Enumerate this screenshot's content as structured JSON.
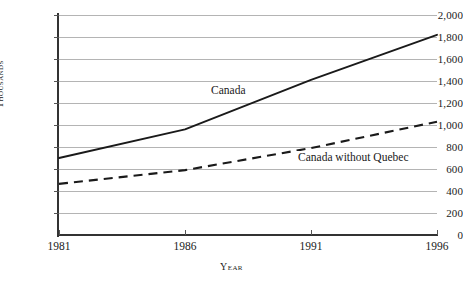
{
  "chart_data": {
    "type": "line",
    "title": "",
    "xlabel": "Year",
    "ylabel": "Thousands",
    "x": [
      1981,
      1986,
      1991,
      1996
    ],
    "xtick_labels": [
      "1981",
      "1986",
      "1991",
      "1996"
    ],
    "xlim": [
      1981,
      1996
    ],
    "ylim": [
      0,
      2000
    ],
    "ytick_labels": [
      "0",
      "200",
      "400",
      "600",
      "800",
      "1,000",
      "1,200",
      "1,400",
      "1,600",
      "1,800",
      "2,000"
    ],
    "ytick_values": [
      0,
      200,
      400,
      600,
      800,
      1000,
      1200,
      1400,
      1600,
      1800,
      2000
    ],
    "grid": true,
    "legend_position": "inline-annotation",
    "series": [
      {
        "name": "Canada",
        "style": "solid",
        "color": "#1a1a1a",
        "values": [
          700,
          960,
          1410,
          1820
        ]
      },
      {
        "name": "Canada without Quebec",
        "style": "dashed",
        "color": "#1a1a1a",
        "values": [
          465,
          590,
          790,
          1030
        ]
      }
    ],
    "annotations": [
      {
        "text": "Canada",
        "x": 1987.2,
        "y": 1250
      },
      {
        "text": "Canada without Quebec",
        "x": 1991.1,
        "y": 640
      }
    ]
  },
  "colors": {
    "gridline": "#b4b4b4",
    "axis": "#333333",
    "ink": "#1a1a1a",
    "background": "#ffffff"
  }
}
